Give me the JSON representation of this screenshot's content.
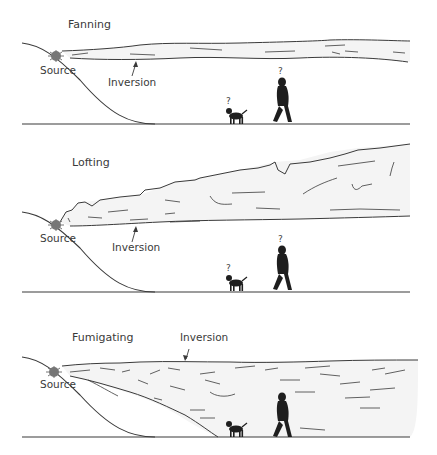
{
  "figure": {
    "panels": [
      {
        "id": "fanning",
        "title": "Fanning",
        "source_label": "Source",
        "inversion_label": "Inversion",
        "observer_marks": [
          "?",
          "?"
        ]
      },
      {
        "id": "lofting",
        "title": "Lofting",
        "source_label": "Source",
        "inversion_label": "Inversion",
        "observer_marks": [
          "?",
          "?"
        ]
      },
      {
        "id": "fumigating",
        "title": "Fumigating",
        "source_label": "Source",
        "inversion_label": "Inversion",
        "observer_marks": []
      }
    ],
    "icons": [
      "smoke-source-icon",
      "person-silhouette-icon",
      "dog-silhouette-icon",
      "arrow-icon"
    ],
    "colors": {
      "line": "#3a3a3a",
      "plume_fill": "#f4f4f4",
      "silhouette": "#1e1e1e"
    }
  }
}
